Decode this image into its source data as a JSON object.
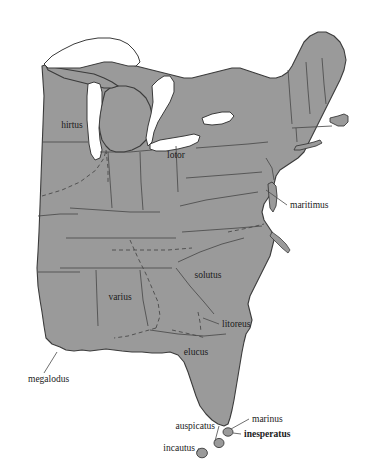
{
  "map": {
    "region": "Eastern United States",
    "background_color": "#ffffff",
    "land_fill": "#9a9a9a",
    "land_stroke": "#3b3b3b",
    "lake_fill": "#ffffff",
    "lake_stroke": "#3b3b3b",
    "internal_boundary_stroke": "#4a4a4a",
    "range_boundary_style": "dashed",
    "island_fill": "#9a9a9a",
    "leader_line_color": "#4a4a4a",
    "inline_labels": [
      {
        "id": "hirtus",
        "text": "hirtus",
        "x": 72,
        "y": 128
      },
      {
        "id": "lotor",
        "text": "lotor",
        "x": 176,
        "y": 158
      },
      {
        "id": "varius",
        "text": "varius",
        "x": 120,
        "y": 300
      },
      {
        "id": "solutus",
        "text": "solutus",
        "x": 208,
        "y": 278
      },
      {
        "id": "elucus",
        "text": "elucus",
        "x": 196,
        "y": 355
      }
    ],
    "callout_labels": [
      {
        "id": "maritimus",
        "text": "maritimus",
        "x": 290,
        "y": 208,
        "anchor": "start",
        "bold": false
      },
      {
        "id": "litoreus",
        "text": "litoreus",
        "x": 222,
        "y": 327,
        "anchor": "start",
        "bold": false
      },
      {
        "id": "megalodus",
        "text": "megalodus",
        "x": 28,
        "y": 382,
        "anchor": "start",
        "bold": false
      },
      {
        "id": "marinus",
        "text": "marinus",
        "x": 252,
        "y": 422,
        "anchor": "start",
        "bold": false
      },
      {
        "id": "inesperatus",
        "text": "inesperatus",
        "x": 244,
        "y": 437,
        "anchor": "start",
        "bold": true
      },
      {
        "id": "auspicatus",
        "text": "auspicatus",
        "x": 215,
        "y": 429,
        "anchor": "end",
        "bold": false
      },
      {
        "id": "incautus",
        "text": "incautus",
        "x": 195,
        "y": 451,
        "anchor": "end",
        "bold": false
      }
    ],
    "islands": [
      {
        "id": "marinus-island",
        "cx": 228,
        "cy": 432,
        "rx": 5.0,
        "ry": 4.2
      },
      {
        "id": "auspicatus-island",
        "cx": 219,
        "cy": 443,
        "rx": 5.0,
        "ry": 4.6
      },
      {
        "id": "incautus-island",
        "cx": 202,
        "cy": 453,
        "rx": 5.4,
        "ry": 4.8
      }
    ],
    "leader_lines": [
      {
        "id": "maritimus-leader",
        "x1": 287,
        "y1": 205,
        "x2": 266,
        "y2": 190
      },
      {
        "id": "litoreus-leader",
        "x1": 219,
        "y1": 324,
        "x2": 203,
        "y2": 318
      },
      {
        "id": "megalodus-leader",
        "x1": 44,
        "y1": 373,
        "x2": 57,
        "y2": 352
      },
      {
        "id": "marinus-leader",
        "x1": 249,
        "y1": 419,
        "x2": 231,
        "y2": 429
      },
      {
        "id": "inesperatus-leader",
        "x1": 241,
        "y1": 434,
        "x2": 233,
        "y2": 433
      },
      {
        "id": "auspicatus-leader",
        "x1": 219,
        "y1": 426,
        "x2": 215,
        "y2": 441
      },
      {
        "id": "incautus-leader",
        "x1": 199,
        "y1": 448,
        "x2": 197,
        "y2": 452
      }
    ]
  }
}
